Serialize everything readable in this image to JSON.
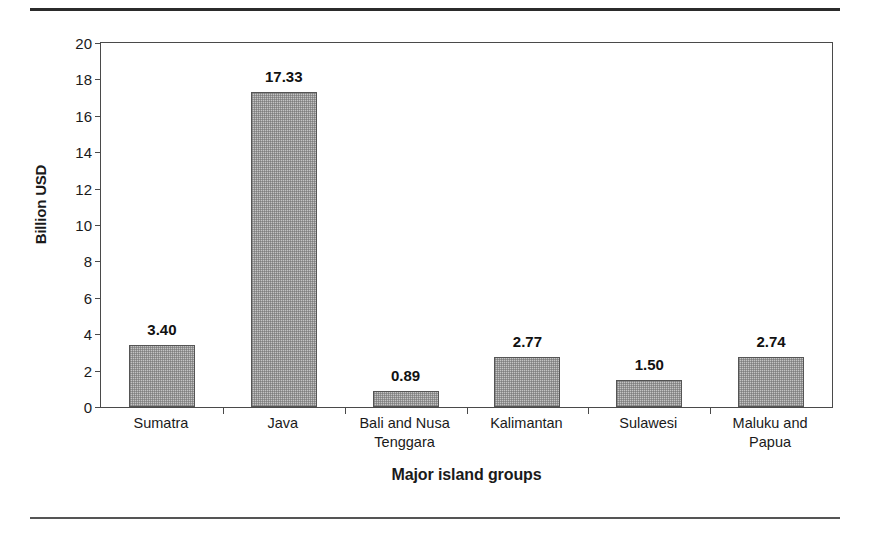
{
  "chart_data": {
    "type": "bar",
    "title": "",
    "subtitle": "",
    "xlabel": "Major island groups",
    "ylabel": "Billion USD",
    "categories": [
      "Sumatra",
      "Java",
      "Bali and Nusa\nTenggara",
      "Kalimantan",
      "Sulawesi",
      "Maluku and Papua"
    ],
    "values": [
      3.4,
      17.33,
      0.89,
      2.77,
      1.5,
      2.74
    ],
    "value_labels": [
      "3.40",
      "17.33",
      "0.89",
      "2.77",
      "1.50",
      "2.74"
    ],
    "ylim": [
      0,
      20
    ],
    "ytick_values": [
      0,
      2,
      4,
      6,
      8,
      10,
      12,
      14,
      16,
      18,
      20
    ],
    "ytick_labels": [
      "0",
      "2",
      "4",
      "6",
      "8",
      "10",
      "12",
      "14",
      "16",
      "18",
      "20"
    ],
    "grid": false,
    "legend": null,
    "bar_fill_color": "#c4c4c4",
    "bar_edge_color": "#555555",
    "axis_color": "#4a4a4a",
    "text_color": "#1a1a1a"
  },
  "figure": {
    "top_rule_color": "#2b2b2b",
    "bottom_rule_color": "#555555"
  }
}
